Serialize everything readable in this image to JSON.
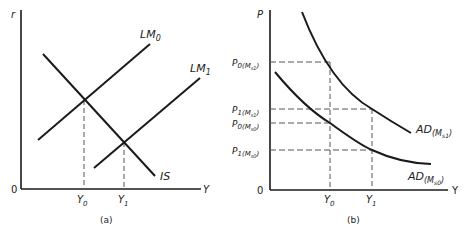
{
  "panel_a": {
    "caption": "(a)",
    "y_axis_label": "r",
    "x_axis_label": "Y",
    "origin_label": "0",
    "curves": {
      "lm0": {
        "name": "LM",
        "sub": "0"
      },
      "lm1": {
        "name": "LM",
        "sub": "1"
      },
      "is": {
        "name": "IS"
      }
    },
    "x_ticks": {
      "y0": {
        "name": "Y",
        "sub": "0"
      },
      "y1": {
        "name": "Y",
        "sub": "1"
      }
    }
  },
  "panel_b": {
    "caption": "(b)",
    "y_axis_label": "P",
    "x_axis_label": "Y",
    "origin_label": "0",
    "curves": {
      "ad_ms1": {
        "name": "AD",
        "sub": "(M",
        "subsub": "s1",
        "close": ")"
      },
      "ad_ms0": {
        "name": "AD",
        "sub": "(M",
        "subsub": "s0",
        "close": ")"
      }
    },
    "y_ticks": {
      "p0_ms1": {
        "name": "P",
        "sub": "0",
        "paren": "(M",
        "subsub": "s1",
        "close": ")"
      },
      "p1_ms1": {
        "name": "P",
        "sub": "1",
        "paren": "(M",
        "subsub": "s1",
        "close": ")"
      },
      "p0_ms0": {
        "name": "P",
        "sub": "0",
        "paren": "(M",
        "subsub": "s0",
        "close": ")"
      },
      "p1_ms0": {
        "name": "P",
        "sub": "1",
        "paren": "(M",
        "subsub": "s0",
        "close": ")"
      }
    },
    "x_ticks": {
      "y0": {
        "name": "Y",
        "sub": "0"
      },
      "y1": {
        "name": "Y",
        "sub": "1"
      }
    }
  },
  "colors": {
    "line": "#1a1a1a",
    "dash": "#555555"
  }
}
